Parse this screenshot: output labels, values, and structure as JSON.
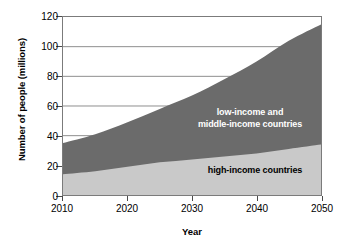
{
  "chart_data": {
    "type": "area",
    "stacked": true,
    "title": "",
    "xlabel": "Year",
    "ylabel": "Number of people (millions)",
    "xlim": [
      2010,
      2050
    ],
    "ylim": [
      0,
      120
    ],
    "xticks": [
      2010,
      2020,
      2030,
      2040,
      2050
    ],
    "yticks": [
      0,
      20,
      40,
      60,
      80,
      100,
      120
    ],
    "xtick_labels": [
      "2010",
      "2020",
      "2030",
      "2040",
      "2050"
    ],
    "ytick_labels": [
      "0",
      "20",
      "40",
      "60",
      "80",
      "100",
      "120"
    ],
    "grid": "horizontal",
    "legend_position": "inside-plot",
    "x": [
      2010,
      2015,
      2020,
      2025,
      2030,
      2035,
      2040,
      2045,
      2050
    ],
    "series": [
      {
        "name": "high-income countries",
        "color": "#c9c9c9",
        "label_color": "#000000",
        "values": [
          14,
          16,
          19,
          22,
          24,
          26,
          28,
          31,
          34
        ]
      },
      {
        "name": "low-income and middle-income countries",
        "color": "#6b6b6b",
        "label_color": "#ffffff",
        "values": [
          21,
          25,
          30,
          36,
          43,
          52,
          62,
          73,
          81
        ]
      }
    ],
    "totals": [
      35,
      41,
      49,
      58,
      67,
      78,
      90,
      104,
      115
    ],
    "annotations": [
      {
        "text_line1": "low-income and",
        "text_line2": "middle-income countries"
      },
      {
        "text": "high-income countries"
      }
    ]
  },
  "axes": {
    "y_title": "Number of people (millions)",
    "x_title": "Year"
  },
  "labels": {
    "low_income_line1": "low-income and",
    "low_income_line2": "middle-income countries",
    "high_income": "high-income countries"
  },
  "colors": {
    "series_low_middle": "#6b6b6b",
    "series_high": "#c9c9c9",
    "axis": "#4a4a4a",
    "grid": "#8f8f8f",
    "plot_border": "#7b7b7b",
    "background": "#ffffff"
  }
}
